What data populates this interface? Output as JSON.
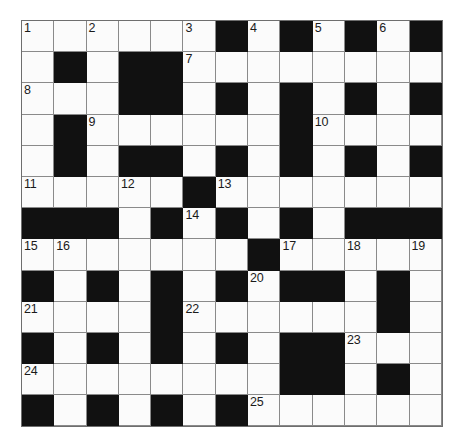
{
  "puzzle": {
    "type": "crossword-grid",
    "title": "Crossword puzzle grid",
    "rows": 13,
    "columns": 13,
    "colors": {
      "block": "#111111",
      "open": "#fbfbfb",
      "rule": "#8a8a8a",
      "number": "#1a1a1a",
      "page_background": "#ffffff"
    },
    "legend": {
      "open_cell": ".",
      "block_cell": "#"
    },
    "grid": [
      "......#.#.#.#",
      ".#.##........",
      "...##.#.#.#.#",
      ".#......#....",
      ".#.##.#.#.#.#",
      ".....#.......",
      "###.#.#.#.###",
      ".......#.....",
      "#.#.#.#.##.#.",
      "....#......#.",
      "#.#.#.#.##...",
      "........##.#.",
      "#.#.#.#......"
    ],
    "numbers": [
      {
        "n": "1",
        "row": 0,
        "col": 0
      },
      {
        "n": "2",
        "row": 0,
        "col": 2
      },
      {
        "n": "3",
        "row": 0,
        "col": 5
      },
      {
        "n": "4",
        "row": 0,
        "col": 7
      },
      {
        "n": "5",
        "row": 0,
        "col": 9
      },
      {
        "n": "6",
        "row": 0,
        "col": 11
      },
      {
        "n": "7",
        "row": 1,
        "col": 5
      },
      {
        "n": "8",
        "row": 2,
        "col": 0
      },
      {
        "n": "9",
        "row": 3,
        "col": 2
      },
      {
        "n": "10",
        "row": 3,
        "col": 9
      },
      {
        "n": "11",
        "row": 5,
        "col": 0
      },
      {
        "n": "12",
        "row": 5,
        "col": 3
      },
      {
        "n": "13",
        "row": 5,
        "col": 6
      },
      {
        "n": "14",
        "row": 6,
        "col": 5
      },
      {
        "n": "15",
        "row": 7,
        "col": 0
      },
      {
        "n": "16",
        "row": 7,
        "col": 1
      },
      {
        "n": "17",
        "row": 7,
        "col": 8
      },
      {
        "n": "18",
        "row": 7,
        "col": 10
      },
      {
        "n": "19",
        "row": 7,
        "col": 12
      },
      {
        "n": "20",
        "row": 8,
        "col": 7
      },
      {
        "n": "21",
        "row": 9,
        "col": 0
      },
      {
        "n": "22",
        "row": 9,
        "col": 5
      },
      {
        "n": "23",
        "row": 10,
        "col": 10
      },
      {
        "n": "24",
        "row": 11,
        "col": 0
      },
      {
        "n": "25",
        "row": 12,
        "col": 7
      }
    ]
  }
}
